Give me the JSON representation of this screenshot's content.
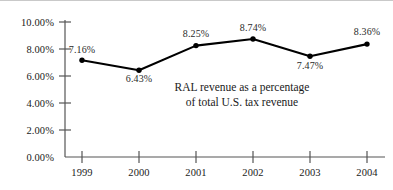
{
  "chart_data": {
    "type": "line",
    "title": "",
    "subtitle": "",
    "xlabel": "",
    "ylabel": "",
    "categories": [
      "1999",
      "2000",
      "2001",
      "2002",
      "2003",
      "2004"
    ],
    "x": [
      1999,
      2000,
      2001,
      2002,
      2003,
      2004
    ],
    "values": [
      7.16,
      6.43,
      8.25,
      8.74,
      7.47,
      8.36
    ],
    "point_labels": [
      "7.16%",
      "6.43%",
      "8.25%",
      "8.74%",
      "7.47%",
      "8.36%"
    ],
    "ylim": [
      0,
      10
    ],
    "yticks": [
      0,
      2,
      4,
      6,
      8,
      10
    ],
    "ytick_labels": [
      "0.00%",
      "2.00%",
      "4.00%",
      "6.00%",
      "8.00%",
      "10.00%"
    ],
    "xtick_labels": [
      "1999",
      "2000",
      "2001",
      "2002",
      "2003",
      "2004"
    ],
    "grid": false,
    "legend": null,
    "annotations": [
      "RAL revenue as a percentage",
      "of total U.S. tax revenue"
    ],
    "series": [
      {
        "name": "RAL revenue as a percentage of total U.S. tax revenue",
        "values": [
          7.16,
          6.43,
          8.25,
          8.74,
          7.47,
          8.36
        ],
        "color": "#000000",
        "marker": "circle",
        "line_width": 2
      }
    ],
    "colors": {
      "line": "#000000",
      "marker": "#000000",
      "axis": "#555555",
      "text": "#1a1a1a",
      "background": "#ffffff"
    }
  },
  "axes": {
    "y_ticks": [
      {
        "label": "10.00%",
        "value": 10
      },
      {
        "label": "8.00%",
        "value": 8
      },
      {
        "label": "6.00%",
        "value": 6
      },
      {
        "label": "4.00%",
        "value": 4
      },
      {
        "label": "2.00%",
        "value": 2
      },
      {
        "label": "0.00%",
        "value": 0
      }
    ],
    "x_ticks": [
      {
        "label": "1999"
      },
      {
        "label": "2000"
      },
      {
        "label": "2001"
      },
      {
        "label": "2002"
      },
      {
        "label": "2003"
      },
      {
        "label": "2004"
      }
    ]
  },
  "point_labels": [
    {
      "text": "7.16%"
    },
    {
      "text": "6.43%"
    },
    {
      "text": "8.25%"
    },
    {
      "text": "8.74%"
    },
    {
      "text": "7.47%"
    },
    {
      "text": "8.36%"
    }
  ],
  "annotation": {
    "line1": "RAL revenue as a percentage",
    "line2": "of total U.S. tax revenue"
  }
}
